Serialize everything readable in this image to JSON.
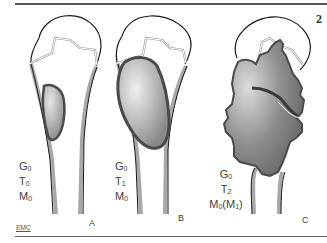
{
  "figure": {
    "number": "2",
    "credit": "EMC",
    "panels": [
      {
        "letter": "A",
        "grade": {
          "base": "G",
          "sub": "0"
        },
        "tumor": {
          "base": "T",
          "sub": "0"
        },
        "metastasis": {
          "base": "M",
          "sub": "0"
        },
        "metastasis_alt": ""
      },
      {
        "letter": "B",
        "grade": {
          "base": "G",
          "sub": "0"
        },
        "tumor": {
          "base": "T",
          "sub": "1"
        },
        "metastasis": {
          "base": "M",
          "sub": "0"
        },
        "metastasis_alt": ""
      },
      {
        "letter": "C",
        "grade": {
          "base": "G",
          "sub": "0"
        },
        "tumor": {
          "base": "T",
          "sub": "2"
        },
        "metastasis": {
          "base": "M",
          "sub": "0"
        },
        "metastasis_alt": {
          "open": "(",
          "base": "M",
          "sub": "1",
          "close": ")"
        }
      }
    ]
  },
  "colors": {
    "outline": "#1a1a1a",
    "cortex": "#a8a8a8",
    "lesion_fill": "#8c8c8c",
    "lesion_edge": "#4a4a4a",
    "rule": "#555555"
  }
}
